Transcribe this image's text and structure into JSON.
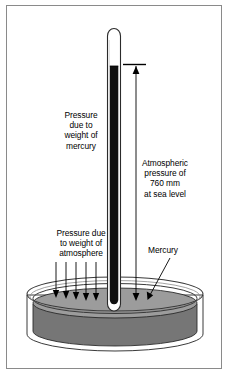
{
  "figure": {
    "background_color": "#ffffff",
    "frame_color": "#8a8a8a",
    "ink_color": "#000000",
    "mercury_column_color": "#111111",
    "dish_mercury_surface_color": "#9c9c9c",
    "dish_mercury_body_color": "#767676",
    "glass_color": "#ffffff"
  },
  "labels": {
    "mercury_weight": {
      "name": "pressure-due-to-weight-of-mercury",
      "lines": [
        "Pressure",
        "due to",
        "weight of",
        "mercury"
      ]
    },
    "atmospheric": {
      "name": "atmospheric-pressure-760mm",
      "lines": [
        "Atmospheric",
        "pressure of",
        "760 mm",
        "at sea level"
      ]
    },
    "atmosphere_weight": {
      "name": "pressure-due-to-weight-of-atmosphere",
      "lines": [
        "Pressure due",
        "to weight of",
        "atmosphere"
      ]
    },
    "mercury": {
      "name": "mercury-pool-callout",
      "lines": [
        "Mercury"
      ]
    }
  },
  "measurements": {
    "barometric_height_value": "760",
    "barometric_height_unit": "mm",
    "condition": "at sea level"
  },
  "diagram_parts": {
    "tube": "glass-tube-sealed-at-top",
    "vacuum_space": "torricellian-vacuum",
    "mercury_column": "mercury-column-in-tube",
    "dish": "mercury-reservoir-dish",
    "atmosphere_arrows_count": 5,
    "measurement_arrow": "height-measurement-arrow-downward"
  }
}
